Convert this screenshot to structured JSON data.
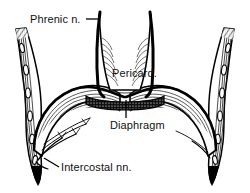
{
  "figure": {
    "name": "thoracic-diaphragm-innervation-diagram",
    "background_color": "#ffffff",
    "ink_color": "#000000",
    "width": 250,
    "height": 193
  },
  "labels": {
    "phrenic": "Phrenic n.",
    "pericard": "Pericard.",
    "diaphragm": "Diaphragm",
    "intercostal": "Intercostal nn."
  },
  "structures": {
    "pericardium": "Pericard.",
    "diaphragm": "Diaphragm",
    "phrenic_nerve_left": "Phrenic n.",
    "phrenic_nerve_right": "Phrenic n.",
    "chest_wall_left": "Intercostal nn.",
    "chest_wall_right": "Intercostal nn."
  }
}
